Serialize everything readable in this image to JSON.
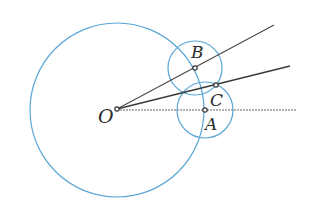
{
  "diagram": {
    "colors": {
      "circle": "#5aa6d6",
      "line": "#4a4a4a",
      "dashed_line": "#6a6a6a",
      "point_fill": "#ffffff",
      "point_stroke": "#333333"
    },
    "points": {
      "O": {
        "label": "O",
        "x": 117,
        "y": 109
      },
      "A": {
        "label": "A",
        "x": 205,
        "y": 110
      },
      "B": {
        "label": "B",
        "x": 195,
        "y": 68
      },
      "C": {
        "label": "C",
        "x": 216,
        "y": 85
      }
    },
    "circles": [
      {
        "name": "circle-centered-O",
        "cx": 117,
        "cy": 110,
        "r": 87
      },
      {
        "name": "circle-centered-B",
        "cx": 195,
        "cy": 68,
        "r": 27
      },
      {
        "name": "circle-centered-A",
        "cx": 205,
        "cy": 110,
        "r": 28
      }
    ],
    "rays": [
      {
        "name": "ray-OB",
        "from": "O",
        "to": [
          274,
          25
        ],
        "style": "solid"
      },
      {
        "name": "ray-OC",
        "from": "O",
        "to": [
          290,
          66
        ],
        "style": "solid"
      },
      {
        "name": "ray-OA",
        "from": "O",
        "to": [
          296,
          110
        ],
        "style": "dashed"
      }
    ],
    "labels": {
      "O": "O",
      "A": "A",
      "B": "B",
      "C": "C"
    }
  }
}
